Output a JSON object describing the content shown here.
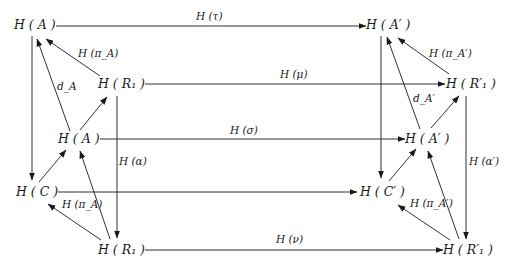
{
  "nodes": {
    "HA_top": "H ( A )",
    "HR1_upper": "H ( R₁ )",
    "HA_mid": "H ( A )",
    "HC": "H ( C )",
    "HR1_bottom": "H ( R₁ )",
    "HAp_top": "H ( A′ )",
    "HR1p_upper": "H ( R′₁ )",
    "HAp_mid": "H ( A′ )",
    "HCp": "H ( C′ )",
    "HR1p_bottom": "H ( R′₁ )"
  },
  "labels": {
    "tau": "H (τ)",
    "mu": "H (μ)",
    "sigma": "H (σ)",
    "nu": "H (ν)",
    "piA_top": "H (π_A)",
    "piA_bottom": "H (π_A)",
    "dA": "d_A",
    "alpha": "H (α)",
    "piAp_top": "H (π_A′)",
    "piAp_bottom": "H (π_A′)",
    "dAp": "d_A′",
    "alphap": "H (α′)"
  },
  "arrows": [
    {
      "from": "H(A)",
      "to": "H(A')",
      "label": "H(τ)"
    },
    {
      "from": "H(R1)",
      "to": "H(R'1)",
      "label": "H(μ)"
    },
    {
      "from": "H(A)",
      "to": "H(A')",
      "label": "H(σ)"
    },
    {
      "from": "H(C)",
      "to": "H(C')",
      "label": ""
    },
    {
      "from": "H(R1)",
      "to": "H(R'1)",
      "label": "H(ν)"
    },
    {
      "from": "H(R1)",
      "to": "H(A)",
      "label": "H(π_A)"
    },
    {
      "from": "H(A)",
      "to": "H(A)",
      "label": "d_A"
    },
    {
      "from": "H(A)",
      "to": "H(R1)",
      "label": ""
    },
    {
      "from": "H(A)",
      "to": "H(C)",
      "label": ""
    },
    {
      "from": "H(C)",
      "to": "H(A)",
      "label": ""
    },
    {
      "from": "H(R1)",
      "to": "H(C)",
      "label": "H(π_A)"
    },
    {
      "from": "H(R1)",
      "to": "H(A)",
      "label": ""
    },
    {
      "from": "H(R1)",
      "to": "H(R1)",
      "label": "H(α)"
    },
    {
      "from": "H(R'1)",
      "to": "H(A')",
      "label": "H(π_A')"
    },
    {
      "from": "H(A')",
      "to": "H(A')",
      "label": "d_A'"
    },
    {
      "from": "H(A')",
      "to": "H(R'1)",
      "label": ""
    },
    {
      "from": "H(A')",
      "to": "H(C')",
      "label": ""
    },
    {
      "from": "H(C')",
      "to": "H(A')",
      "label": ""
    },
    {
      "from": "H(R'1)",
      "to": "H(C')",
      "label": "H(π_A')"
    },
    {
      "from": "H(R'1)",
      "to": "H(A')",
      "label": ""
    },
    {
      "from": "H(R'1)",
      "to": "H(R'1)",
      "label": "H(α')"
    }
  ]
}
